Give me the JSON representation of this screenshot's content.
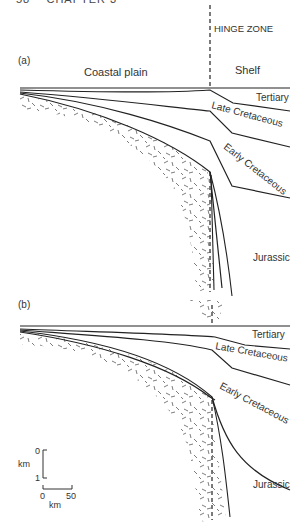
{
  "page_header": "58    CHAPTER 3",
  "panels": [
    {
      "id": "a",
      "label": "(a)",
      "hinge_label": "HINGE ZONE",
      "regions": {
        "left": "Coastal plain",
        "right": "Shelf"
      },
      "units": [
        "Tertiary",
        "Late Cretaceous",
        "Early Cretaceous",
        "Jurassic"
      ]
    },
    {
      "id": "b",
      "label": "(b)",
      "units": [
        "Tertiary",
        "Late Cretaceous",
        "Early Cretaceous",
        "Jurassic"
      ]
    }
  ],
  "scale": {
    "vertical": {
      "top": "0",
      "bottom": "1",
      "unit": "km"
    },
    "horizontal": {
      "left": "0",
      "right": "50",
      "unit": "km"
    }
  },
  "colors": {
    "line": "#222222",
    "pattern": "#555555"
  }
}
